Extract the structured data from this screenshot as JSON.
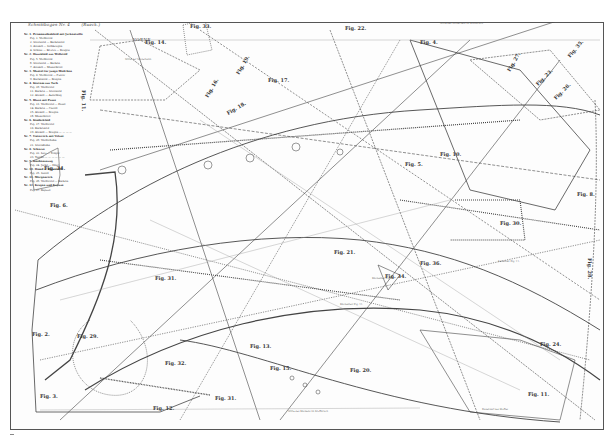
{
  "document": {
    "handwritten_note": [
      "Schnittbogen Nr. 4",
      "(Rueck.)"
    ],
    "title_word": "VORNE",
    "legend_rows": [
      {
        "text": "Nr. 1. Promenadenkleid mit Jackentaille",
        "bold": true
      },
      {
        "text": "Fig. 1. Vorderteil",
        "indent": true
      },
      {
        "text": "2. Seitenteil — Rückenteil",
        "indent": true
      },
      {
        "text": "3. Aermel — Stehkragen",
        "indent": true
      },
      {
        "text": "4. Schoss — Revers — Kragen",
        "indent": true
      },
      {
        "text": "Nr. 2. Hauskleid aus Wollstoff",
        "bold": true
      },
      {
        "text": "Fig. 5. Vorderteil",
        "indent": true
      },
      {
        "text": "6. Seitenteil — Rücken",
        "indent": true
      },
      {
        "text": "7. Aermel — Manschette",
        "indent": true
      },
      {
        "text": "Nr. 3. Mantel für junge Mädchen",
        "bold": true
      },
      {
        "text": "Fig. 8. Vorderteil — Futter",
        "indent": true
      },
      {
        "text": "9. Rückenteil — Kragen",
        "indent": true
      },
      {
        "text": "Nr. 4. Kostüm aus Tuch",
        "bold": true
      },
      {
        "text": "Fig. 10. Vorderteil",
        "indent": true
      },
      {
        "text": "11. Rücken — Seitenteil",
        "indent": true
      },
      {
        "text": "12. Aermel — Aufschlag",
        "indent": true
      },
      {
        "text": "Nr. 5. Bluse mit Passe",
        "bold": true
      },
      {
        "text": "Fig. 13. Vorderteil — Passe",
        "indent": true
      },
      {
        "text": "14. Rücken — Gürtel",
        "indent": true
      },
      {
        "text": "15. Aermel — Kragen",
        "indent": true
      },
      {
        "text": "16. Manschette",
        "indent": true
      },
      {
        "text": "Nr. 6. Kinderkleid",
        "bold": true
      },
      {
        "text": "Fig. 17. Vorderteil",
        "indent": true
      },
      {
        "text": "18. Rückenteil",
        "indent": true
      },
      {
        "text": "19. Aermel — Kragen — — — —",
        "indent": true
      },
      {
        "text": "Nr. 7. Unterrock mit Volant",
        "bold": true
      },
      {
        "text": "Fig. 20. Vorderbahn",
        "indent": true
      },
      {
        "text": "21. Seitenbahn",
        "indent": true
      },
      {
        "text": "Nr. 8. Schürze",
        "bold": true
      },
      {
        "text": "Fig. 22. Latz — Träger",
        "indent": true
      },
      {
        "text": "23. Tasche — — — — — —",
        "indent": true
      },
      {
        "text": "Nr. 9. Knabenanzug",
        "bold": true
      },
      {
        "text": "Fig. 24. Jacke — Hose",
        "indent": true
      },
      {
        "text": "Nr. 10. Hemd — Beinkleid",
        "bold": true
      },
      {
        "text": "Fig. 25. Sattel",
        "indent": true
      },
      {
        "text": "Nr. 11. Morgenrock",
        "bold": true
      },
      {
        "text": "Fig. 26. Vorderteil — Rücken",
        "indent": true
      },
      {
        "text": "Nr. 12. Kragen und Kapuze",
        "bold": true
      },
      {
        "text": "Fig. 27. Kapuze",
        "indent": true
      }
    ],
    "figure_labels": [
      {
        "id": "fig-14",
        "text": "Fig. 14.",
        "x": 145,
        "y": 44,
        "rot": 0
      },
      {
        "id": "fig-33",
        "text": "Fig. 33.",
        "x": 190,
        "y": 28,
        "rot": 0
      },
      {
        "id": "fig-22-top",
        "text": "Fig. 22.",
        "x": 345,
        "y": 30,
        "rot": 0
      },
      {
        "id": "fig-4-top",
        "text": "Fig. 4.",
        "x": 420,
        "y": 44,
        "rot": 0
      },
      {
        "id": "fig-11-left",
        "text": "Fig. 11.",
        "x": 82,
        "y": 90,
        "rot": 90
      },
      {
        "id": "fig-19",
        "text": "Fig. 19.",
        "x": 239,
        "y": 75,
        "rot": -60
      },
      {
        "id": "fig-17",
        "text": "Fig. 17.",
        "x": 268,
        "y": 82,
        "rot": 0
      },
      {
        "id": "fig-16",
        "text": "Fig. 16.",
        "x": 208,
        "y": 98,
        "rot": -60
      },
      {
        "id": "fig-18",
        "text": "Fig. 18.",
        "x": 228,
        "y": 115,
        "rot": -30
      },
      {
        "id": "fig-27",
        "text": "Fig. 27.",
        "x": 510,
        "y": 72,
        "rot": -60
      },
      {
        "id": "fig-23-r",
        "text": "Fig. 23.",
        "x": 538,
        "y": 86,
        "rot": -45
      },
      {
        "id": "fig-26-r",
        "text": "Fig. 26.",
        "x": 556,
        "y": 100,
        "rot": -45
      },
      {
        "id": "fig-35",
        "text": "Fig. 35.",
        "x": 570,
        "y": 58,
        "rot": -50
      },
      {
        "id": "fig-34-left",
        "text": "Fig. 34.",
        "x": 44,
        "y": 170,
        "rot": 0
      },
      {
        "id": "fig-6",
        "text": "Fig. 6.",
        "x": 50,
        "y": 207,
        "rot": 0
      },
      {
        "id": "fig-10",
        "text": "Fig. 10.",
        "x": 440,
        "y": 156,
        "rot": 0
      },
      {
        "id": "fig-5",
        "text": "Fig. 5.",
        "x": 405,
        "y": 166,
        "rot": 0
      },
      {
        "id": "fig-8",
        "text": "Fig. 8.",
        "x": 577,
        "y": 196,
        "rot": 0
      },
      {
        "id": "fig-30",
        "text": "Fig. 30.",
        "x": 500,
        "y": 225,
        "rot": 0
      },
      {
        "id": "fig-21",
        "text": "Fig. 21.",
        "x": 334,
        "y": 254,
        "rot": 0
      },
      {
        "id": "fig-36",
        "text": "Fig. 36.",
        "x": 420,
        "y": 265,
        "rot": 0
      },
      {
        "id": "fig-31-mid",
        "text": "Fig. 31.",
        "x": 155,
        "y": 280,
        "rot": 0
      },
      {
        "id": "fig-34-mid",
        "text": "Fig. 34.",
        "x": 385,
        "y": 278,
        "rot": 0
      },
      {
        "id": "fig-28-r",
        "text": "Fig. 28.",
        "x": 588,
        "y": 258,
        "rot": 90
      },
      {
        "id": "fig-2",
        "text": "Fig. 2.",
        "x": 32,
        "y": 336,
        "rot": 0
      },
      {
        "id": "fig-29",
        "text": "Fig. 29.",
        "x": 77,
        "y": 338,
        "rot": 0
      },
      {
        "id": "fig-32",
        "text": "Fig. 32.",
        "x": 165,
        "y": 365,
        "rot": 0
      },
      {
        "id": "fig-3",
        "text": "Fig. 3.",
        "x": 40,
        "y": 398,
        "rot": 0
      },
      {
        "id": "fig-12",
        "text": "Fig. 12.",
        "x": 153,
        "y": 410,
        "rot": 0
      },
      {
        "id": "fig-31-bottom",
        "text": "Fig. 31.",
        "x": 215,
        "y": 400,
        "rot": 0
      },
      {
        "id": "fig-20",
        "text": "Fig. 20.",
        "x": 350,
        "y": 372,
        "rot": 0
      },
      {
        "id": "fig-13",
        "text": "Fig. 13.",
        "x": 250,
        "y": 348,
        "rot": 0
      },
      {
        "id": "fig-24",
        "text": "Fig. 24.",
        "x": 540,
        "y": 346,
        "rot": 0
      },
      {
        "id": "fig-11-bottom",
        "text": "Fig. 11.",
        "x": 528,
        "y": 396,
        "rot": 0
      },
      {
        "id": "fig-15",
        "text": "Fig. 15.",
        "x": 270,
        "y": 370,
        "rot": 0
      }
    ],
    "annotations": [
      {
        "text": "Mitte des Vorderteils im Stoffbruch",
        "x": 440,
        "y": 24
      },
      {
        "text": "Mitte der Vorderbahn",
        "x": 125,
        "y": 60
      },
      {
        "text": "Mitte des Rückens im Stoffbruch",
        "x": 288,
        "y": 412
      },
      {
        "text": "Fadenlauf des Stoffes",
        "x": 482,
        "y": 410
      },
      {
        "text": "Rückenteil Fig. 11.",
        "x": 372,
        "y": 279
      },
      {
        "text": "Rückenteil Fig. 11.",
        "x": 340,
        "y": 305
      },
      {
        "text": "Seitenteil Fig. 11.",
        "x": 498,
        "y": 262
      }
    ]
  }
}
